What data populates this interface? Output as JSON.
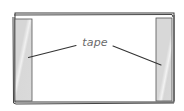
{
  "diagram": {
    "label": "tape",
    "colors": {
      "outline": "#3a3a3a",
      "tape_fill": "#d9d9d9",
      "tape_sheen": "#f2f2f2",
      "paper": "#ffffff",
      "label_text": "#6a6a6a"
    },
    "elements": [
      {
        "type": "paper-sheet",
        "description": "double-outlined rectangle"
      },
      {
        "type": "tape-strip",
        "side": "left"
      },
      {
        "type": "tape-strip",
        "side": "right"
      },
      {
        "type": "leader-line",
        "target": "left tape strip"
      },
      {
        "type": "leader-line",
        "target": "right tape strip"
      }
    ]
  }
}
